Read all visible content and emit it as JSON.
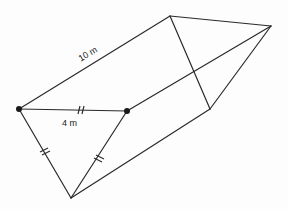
{
  "diagram": {
    "type": "triangular-prism",
    "labels": {
      "length": "10 m",
      "side": "4 m"
    },
    "vertices": {
      "A": [
        19,
        109
      ],
      "B": [
        127,
        111
      ],
      "C": [
        71,
        198
      ],
      "D": [
        170,
        16
      ],
      "E": [
        271,
        26
      ],
      "F": [
        210,
        109
      ]
    },
    "edges": [
      [
        "A",
        "B"
      ],
      [
        "A",
        "C"
      ],
      [
        "B",
        "C"
      ],
      [
        "A",
        "D"
      ],
      [
        "B",
        "E"
      ],
      [
        "C",
        "F"
      ],
      [
        "D",
        "E"
      ],
      [
        "D",
        "F"
      ],
      [
        "E",
        "F"
      ]
    ],
    "equal_side_marks": [
      "A-B",
      "A-C",
      "B-C"
    ],
    "marked_vertices": [
      "A",
      "B"
    ],
    "colors": {
      "line": "#2a2a2a",
      "background": "#fdfdfd"
    }
  }
}
